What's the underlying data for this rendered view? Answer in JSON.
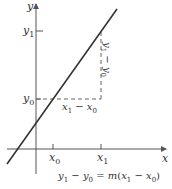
{
  "diagram": {
    "type": "slope-of-line",
    "axes": {
      "x_label": "x",
      "y_label": "y"
    },
    "ticks": {
      "x0": "x",
      "x0_sub": "0",
      "x1": "x",
      "x1_sub": "1",
      "y0": "y",
      "y0_sub": "0",
      "y1": "y",
      "y1_sub": "1"
    },
    "run_label": {
      "a": "x",
      "a_sub": "1",
      "op": " − ",
      "b": "x",
      "b_sub": "0"
    },
    "rise_label": {
      "a": "y",
      "a_sub": "1",
      "op": " − ",
      "b": "y",
      "b_sub": "0"
    },
    "equation": {
      "y1": "y",
      "y1_sub": "1",
      "minus1": " − ",
      "y0": "y",
      "y0_sub": "0",
      "eq": " = ",
      "m": "m",
      "open": "(",
      "x1": "x",
      "x1_sub": "1",
      "minus2": " − ",
      "x0": "x",
      "x0_sub": "0",
      "close": ")"
    },
    "colors": {
      "line": "#333333",
      "axis": "#555555",
      "dashed": "#666666"
    }
  }
}
